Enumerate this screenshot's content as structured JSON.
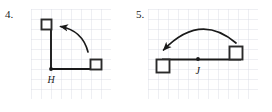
{
  "page": {
    "background_color": "#ffffff",
    "ink_color": "#1a1a1a",
    "grid_line_color": "#d9dde4"
  },
  "problems": [
    {
      "number_label": "4.",
      "center_point_label": "H",
      "grid": {
        "cell_size": 10,
        "columns": 8,
        "rows": 9,
        "width": 80,
        "height": 90
      },
      "figure": {
        "type": "rotation",
        "center": {
          "x": 20,
          "y": 60
        },
        "rotation_direction": "counterclockwise",
        "rotation_degrees": 90,
        "preimage_square": {
          "x": 50,
          "y": 50,
          "size": 10
        },
        "image_square": {
          "x": 10,
          "y": 10,
          "size": 10
        },
        "segments": [
          {
            "from": {
              "x": 20,
              "y": 60
            },
            "to": {
              "x": 20,
              "y": 20
            }
          },
          {
            "from": {
              "x": 20,
              "y": 60
            },
            "to": {
              "x": 60,
              "y": 60
            }
          }
        ],
        "arrow": {
          "start": {
            "x": 57,
            "y": 42
          },
          "end": {
            "x": 28,
            "y": 17
          },
          "control": {
            "x": 50,
            "y": 20
          },
          "arrowhead_at": "end"
        }
      }
    },
    {
      "number_label": "5.",
      "center_point_label": "J",
      "grid": {
        "cell_size": 10,
        "columns": 11,
        "rows": 9,
        "width": 110,
        "height": 90
      },
      "figure": {
        "type": "rotation",
        "center": {
          "x": 50,
          "y": 50
        },
        "rotation_direction": "counterclockwise",
        "rotation_degrees": 180,
        "preimage_square": {
          "x": 80,
          "y": 35,
          "size": 13
        },
        "image_square": {
          "x": 7,
          "y": 50,
          "size": 13
        },
        "segments": [
          {
            "from": {
              "x": 20,
              "y": 50
            },
            "to": {
              "x": 50,
              "y": 50
            }
          },
          {
            "from": {
              "x": 50,
              "y": 50
            },
            "to": {
              "x": 88,
              "y": 50
            }
          }
        ],
        "arrow": {
          "start": {
            "x": 88,
            "y": 33
          },
          "end": {
            "x": 14,
            "y": 42
          },
          "control": {
            "x": 50,
            "y": 5
          },
          "arrowhead_at": "end"
        }
      }
    }
  ]
}
